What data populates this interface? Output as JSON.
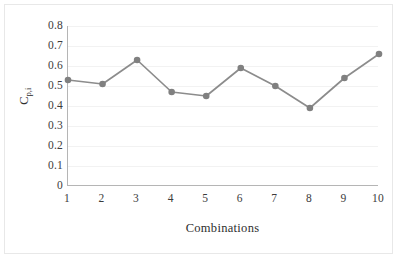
{
  "chart_data": {
    "type": "line",
    "title": "",
    "xlabel": "Combinations",
    "ylabel": "C",
    "ylabel_subscript": "p,i",
    "categories": [
      "1",
      "2",
      "3",
      "4",
      "5",
      "6",
      "7",
      "8",
      "9",
      "10"
    ],
    "x": [
      1,
      2,
      3,
      4,
      5,
      6,
      7,
      8,
      9,
      10
    ],
    "values": [
      0.53,
      0.51,
      0.63,
      0.47,
      0.45,
      0.59,
      0.5,
      0.39,
      0.54,
      0.66
    ],
    "series": [
      {
        "name": "Cp,i",
        "values": [
          0.53,
          0.51,
          0.63,
          0.47,
          0.45,
          0.59,
          0.5,
          0.39,
          0.54,
          0.66
        ]
      }
    ],
    "ylim": [
      0,
      0.8
    ],
    "xlim": [
      1,
      10
    ],
    "yticks": [
      0,
      0.1,
      0.2,
      0.3,
      0.4,
      0.5,
      0.6,
      0.7,
      0.8
    ],
    "ytick_labels": [
      "0",
      "0.1",
      "0.2",
      "0.3",
      "0.4",
      "0.5",
      "0.6",
      "0.7",
      "0.8"
    ],
    "grid": true,
    "grid_axis": "y",
    "legend": false,
    "legend_position": "none",
    "marker": "circle",
    "line_color": "#8c8c8c",
    "marker_color": "#808080",
    "grid_color": "#f2f2f2",
    "axis_color": "#b5b5b5",
    "background_color": "#ffffff"
  }
}
